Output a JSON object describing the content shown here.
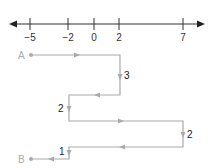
{
  "number_line": {
    "ticks": [
      {
        "label": "−5",
        "x": 30
      },
      {
        "label": "−2",
        "x": 68
      },
      {
        "label": "0",
        "x": 94
      },
      {
        "label": "2",
        "x": 119
      },
      {
        "label": "7",
        "x": 183
      }
    ]
  },
  "path": {
    "start_label": "A",
    "end_label": "B",
    "steps": [
      {
        "label": "3"
      },
      {
        "label": "2"
      },
      {
        "label": "2"
      },
      {
        "label": "1"
      }
    ]
  },
  "colors": {
    "line": "#333333",
    "path": "#aaaaaa"
  }
}
